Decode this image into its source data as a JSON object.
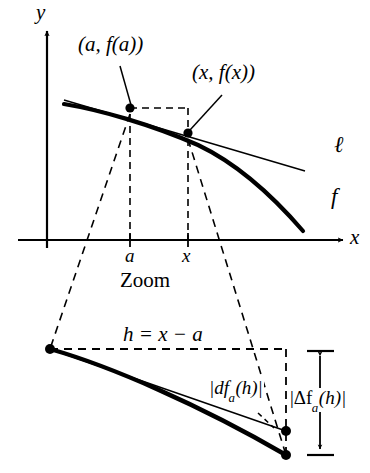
{
  "figure": {
    "title_text": "Zoom",
    "colors": {
      "ink": "#000000",
      "background": "#ffffff"
    }
  },
  "axes": {
    "y_label": "y",
    "x_label": "x",
    "tick_labels": [
      {
        "name": "a",
        "text": "a"
      },
      {
        "name": "x",
        "text": "x"
      }
    ]
  },
  "curve_labels": {
    "tangent_line": "ℓ",
    "function": "f"
  },
  "point_labels": {
    "point_a": "(a, f(a))",
    "point_x": "(x, f(x))"
  },
  "zoom_panel": {
    "caption": "Zoom",
    "h_label": "h = x − a",
    "differential_label_prefix": "|df",
    "differential_label_sub": "a",
    "differential_label_suffix": "(h)|",
    "increment_label_prefix": "|Δf",
    "increment_label_sub": "a",
    "increment_label_suffix": "(h)|"
  }
}
